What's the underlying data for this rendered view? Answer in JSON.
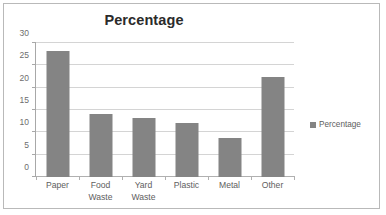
{
  "chart_data": {
    "type": "bar",
    "title": "Percentage",
    "xlabel": "",
    "ylabel": "",
    "categories": [
      "Paper",
      "Food Waste",
      "Yard Waste",
      "Plastic",
      "Metal",
      "Other"
    ],
    "category_lines": [
      [
        "Paper"
      ],
      [
        "Food",
        "Waste"
      ],
      [
        "Yard",
        "Waste"
      ],
      [
        "Plastic"
      ],
      [
        "Metal"
      ],
      [
        "Other"
      ]
    ],
    "values": [
      28.2,
      14.0,
      13.2,
      12.2,
      8.8,
      22.5
    ],
    "series": [
      {
        "name": "Percentage",
        "values": [
          28.2,
          14.0,
          13.2,
          12.2,
          8.8,
          22.5
        ],
        "color": "#848484"
      }
    ],
    "ylim": [
      0,
      30
    ],
    "yticks": [
      0,
      5,
      10,
      15,
      20,
      25,
      30
    ],
    "ytick_labels": [
      "0",
      "5",
      "10",
      "15",
      "20",
      "25",
      "30"
    ],
    "grid": true,
    "legend": {
      "position": "right",
      "entries": [
        "Percentage"
      ]
    }
  },
  "legend": {
    "label": "Percentage",
    "swatch_color": "#848484"
  },
  "style": {
    "bar_color": "#848484",
    "grid_color": "#d4d4d4",
    "axis_color": "#a8a8a8",
    "text_color": "#5e5e5e",
    "title_color": "#2b2b2b",
    "frame_color": "#b9b9b9",
    "background": "#ffffff"
  }
}
